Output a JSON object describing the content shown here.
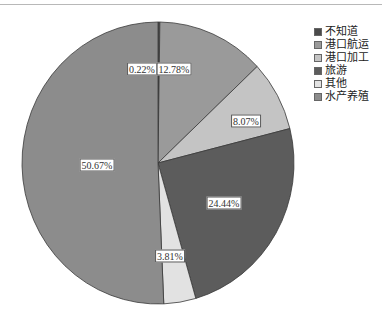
{
  "chart_data": {
    "type": "pie",
    "title": "",
    "start_angle_deg": 0,
    "direction": "clockwise",
    "categories": [
      "不知道",
      "港口航运",
      "港口加工",
      "旅游",
      "其他",
      "水产养殖"
    ],
    "values": [
      0.22,
      12.78,
      8.07,
      24.44,
      3.81,
      50.67
    ],
    "labels": [
      "0.22%",
      "12.78%",
      "8.07%",
      "24.44%",
      "3.81%",
      "50.67%"
    ],
    "colors": [
      "#4a4a4a",
      "#9a9a9a",
      "#c4c4c4",
      "#5c5c5c",
      "#e2e2e2",
      "#8c8c8c"
    ],
    "legend_position": "right",
    "center": [
      158,
      163
    ],
    "radius": [
      136,
      141
    ]
  },
  "legend": {
    "items": [
      {
        "label": "不知道",
        "color": "#4a4a4a"
      },
      {
        "label": "港口航运",
        "color": "#9a9a9a"
      },
      {
        "label": "港口加工",
        "color": "#c4c4c4"
      },
      {
        "label": "旅游",
        "color": "#5c5c5c"
      },
      {
        "label": "其他",
        "color": "#e2e2e2"
      },
      {
        "label": "水产养殖",
        "color": "#8c8c8c"
      }
    ]
  },
  "slice_labels": [
    {
      "text": "0.22%",
      "x": 142,
      "y": 69
    },
    {
      "text": "12.78%",
      "x": 174,
      "y": 69
    },
    {
      "text": "8.07%",
      "x": 246,
      "y": 121
    },
    {
      "text": "24.44%",
      "x": 224,
      "y": 203
    },
    {
      "text": "3.81%",
      "x": 170,
      "y": 256
    },
    {
      "text": "50.67%",
      "x": 97,
      "y": 165
    }
  ]
}
